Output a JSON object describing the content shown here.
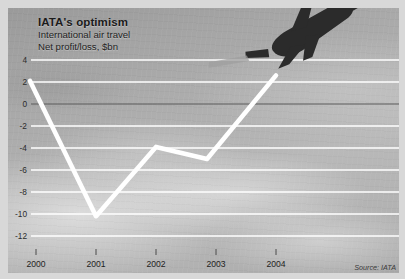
{
  "title": "IATA's optimism",
  "subtitle": "International air travel",
  "axis_note": "Net profit/loss, $bn",
  "source": "Source: IATA",
  "colors": {
    "line": "#ffffff",
    "gridline": "#ffffff",
    "zero_line": "#555555",
    "text": "#1b1b1b",
    "plane": "#2e2e2e"
  },
  "icons": {
    "plane": "airplane-takeoff-icon"
  },
  "chart_data": {
    "type": "line",
    "title": "IATA's optimism",
    "subtitle": "International air travel",
    "ylabel": "Net profit/loss, $bn",
    "xlabel": "",
    "source": "Source: IATA",
    "grid": true,
    "legend": "none",
    "ylim": [
      -13,
      5
    ],
    "yticks": [
      4,
      2,
      0,
      -2,
      -4,
      -6,
      -8,
      -10,
      -12
    ],
    "ytick_labels": [
      "4",
      "2",
      "0",
      "-2",
      "-4",
      "-6",
      "-8",
      "-10",
      "-12"
    ],
    "xticks": [
      2000,
      2001,
      2002,
      2003,
      2004
    ],
    "xtick_labels": [
      "2000",
      "2001",
      "2002",
      "2003",
      "2004"
    ],
    "x": [
      1999.9,
      2001.0,
      2002.0,
      2002.85,
      2004.0
    ],
    "values": [
      2.1,
      -10.2,
      -3.9,
      -5.0,
      2.6
    ],
    "points": [
      {
        "x": 1999.9,
        "y": 2.1
      },
      {
        "x": 2001.0,
        "y": -10.2
      },
      {
        "x": 2002.0,
        "y": -3.9
      },
      {
        "x": 2002.85,
        "y": -5.0
      },
      {
        "x": 2004.0,
        "y": 2.6
      }
    ]
  }
}
